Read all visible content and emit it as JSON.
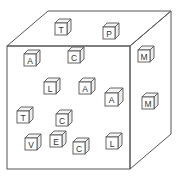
{
  "figure": {
    "big_cube": {
      "front": {
        "x1": 7,
        "y1": 46,
        "x2": 130,
        "y2": 169
      },
      "back_offset": {
        "dx": 41,
        "dy": -35
      }
    },
    "small_cubes": [
      {
        "letter": "T",
        "x": 55,
        "y": 23,
        "s": 12
      },
      {
        "letter": "P",
        "x": 103,
        "y": 27,
        "s": 12
      },
      {
        "letter": "A",
        "x": 24,
        "y": 54,
        "s": 12
      },
      {
        "letter": "C",
        "x": 68,
        "y": 51,
        "s": 12
      },
      {
        "letter": "M",
        "x": 138,
        "y": 50,
        "s": 12
      },
      {
        "letter": "L",
        "x": 44,
        "y": 82,
        "s": 12
      },
      {
        "letter": "A",
        "x": 79,
        "y": 82,
        "s": 12
      },
      {
        "letter": "A",
        "x": 105,
        "y": 93,
        "s": 13
      },
      {
        "letter": "M",
        "x": 142,
        "y": 97,
        "s": 12
      },
      {
        "letter": "T",
        "x": 17,
        "y": 111,
        "s": 12
      },
      {
        "letter": "C",
        "x": 56,
        "y": 114,
        "s": 12
      },
      {
        "letter": "V",
        "x": 25,
        "y": 138,
        "s": 12
      },
      {
        "letter": "E",
        "x": 50,
        "y": 135,
        "s": 12
      },
      {
        "letter": "C",
        "x": 73,
        "y": 142,
        "s": 12
      },
      {
        "letter": "L",
        "x": 106,
        "y": 137,
        "s": 12
      }
    ]
  }
}
